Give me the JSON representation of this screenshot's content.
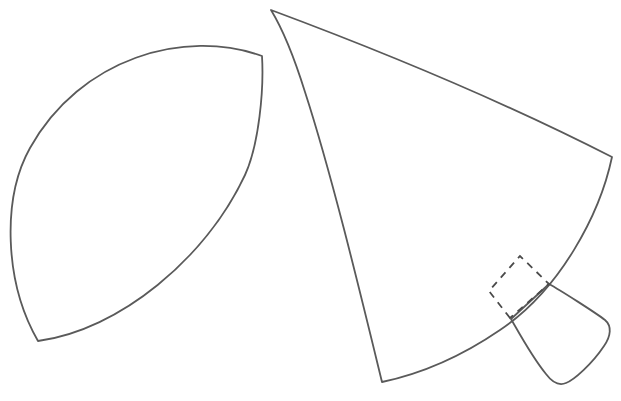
{
  "canvas": {
    "width": 621,
    "height": 401,
    "background_color": "#ffffff",
    "title": "Sewing pattern outline drawing"
  },
  "style": {
    "stroke_color": "#5a5a5a",
    "stroke_width": 1.8,
    "dash_stroke_color": "#4a4a4a",
    "dash_pattern": "7 6",
    "fill": "none"
  },
  "shapes": {
    "leaf": {
      "name": "leaf-shape",
      "label": "Pointed oval pattern piece",
      "vertices": [
        {
          "x": 262,
          "y": 56
        },
        {
          "x": 38,
          "y": 341
        }
      ],
      "path": "M 262 56 C 185 28 80 58 30 148 C 2 198 4 282 38 341 C 120 330 206 258 245 175 C 259 144 264 90 262 56 Z"
    },
    "fan": {
      "name": "fan-shape",
      "label": "Large fan pattern piece",
      "vertices": [
        {
          "x": 271,
          "y": 10
        },
        {
          "x": 612,
          "y": 157
        },
        {
          "x": 382,
          "y": 382
        }
      ],
      "path": "M 271 10 C 400 58 520 110 612 157 C 600 214 560 290 500 330 C 462 356 420 374 382 382 C 362 300 332 175 305 92 C 295 60 282 28 271 10 Z"
    },
    "dashed_square": {
      "name": "dashed-seam-allowance",
      "label": "Dashed rotated square marking",
      "vertices": [
        {
          "x": 510,
          "y": 318
        },
        {
          "x": 489,
          "y": 291
        },
        {
          "x": 520,
          "y": 256
        },
        {
          "x": 549,
          "y": 284
        }
      ],
      "path": "M 510 318 L 489 291 L 520 256 L 549 284 Z"
    },
    "tab": {
      "name": "tab-shape",
      "label": "Small tab pattern piece",
      "vertices": [
        {
          "x": 510,
          "y": 318
        },
        {
          "x": 549,
          "y": 284
        },
        {
          "x": 608,
          "y": 322
        },
        {
          "x": 561,
          "y": 383
        }
      ],
      "path": "M 511 319 L 549 284 C 560 290 596 313 605 320 C 612 326 611 336 604 346 C 592 364 574 380 566 383 C 559 386 552 382 546 374 C 532 357 518 331 511 319 Z"
    }
  },
  "legend": {
    "solid_meaning": "Cut line",
    "dashed_meaning": "Fold / placement line"
  }
}
